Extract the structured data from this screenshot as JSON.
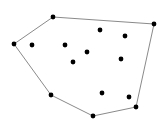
{
  "diagram": {
    "type": "convex-hull",
    "colors": {
      "background": "#ffffff",
      "point": "#000000",
      "hull_edge": "#8a8a8a"
    },
    "coordinate_units": "image pixels (origin top-left), data coordinates of the point set",
    "hull_points": [
      {
        "id": "h1",
        "x": 53,
        "y": 17
      },
      {
        "id": "h2",
        "x": 154,
        "y": 24
      },
      {
        "id": "h3",
        "x": 136,
        "y": 107
      },
      {
        "id": "h4",
        "x": 93,
        "y": 116
      },
      {
        "id": "h5",
        "x": 51,
        "y": 95
      },
      {
        "id": "h6",
        "x": 14,
        "y": 44
      }
    ],
    "interior_points": [
      {
        "id": "p1",
        "x": 32,
        "y": 45
      },
      {
        "id": "p2",
        "x": 65,
        "y": 45
      },
      {
        "id": "p3",
        "x": 100,
        "y": 30
      },
      {
        "id": "p4",
        "x": 125,
        "y": 36
      },
      {
        "id": "p5",
        "x": 87,
        "y": 52
      },
      {
        "id": "p6",
        "x": 73,
        "y": 62
      },
      {
        "id": "p7",
        "x": 121,
        "y": 59
      },
      {
        "id": "p8",
        "x": 102,
        "y": 93
      },
      {
        "id": "p9",
        "x": 129,
        "y": 97
      }
    ]
  }
}
